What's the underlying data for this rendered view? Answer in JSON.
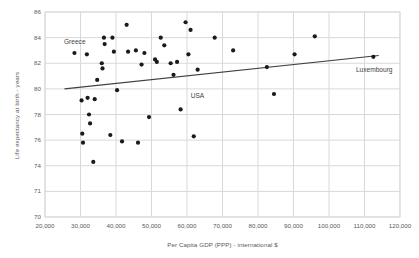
{
  "chart_data": {
    "type": "scatter",
    "title": "",
    "xlabel": "Per Capita GDP (PPP) - international $",
    "ylabel": "Life expectancy at birth - years",
    "xlim": [
      20000,
      120000
    ],
    "ylim": [
      70,
      86
    ],
    "xticks": [
      "20,000",
      "30,000",
      "40,000",
      "50,000",
      "60,000",
      "70,000",
      "80,000",
      "90,000",
      "100,000",
      "110,000",
      "120,000"
    ],
    "yticks": [
      "70",
      "71",
      "74",
      "76",
      "78",
      "80",
      "82",
      "84",
      "86"
    ],
    "ytick_values": [
      70,
      72,
      74,
      76,
      78,
      80,
      82,
      84,
      86
    ],
    "grid": "both",
    "legend": "none",
    "marker_color": "#1a1a1a",
    "trendline_color": "#404040",
    "gridline_color": "#d9d9d9",
    "points": [
      {
        "x": 28300,
        "y": 82.8
      },
      {
        "x": 30300,
        "y": 79.1
      },
      {
        "x": 30500,
        "y": 76.5
      },
      {
        "x": 30700,
        "y": 75.8
      },
      {
        "x": 31800,
        "y": 82.7
      },
      {
        "x": 32000,
        "y": 79.3
      },
      {
        "x": 32400,
        "y": 78.0
      },
      {
        "x": 32700,
        "y": 77.3
      },
      {
        "x": 33600,
        "y": 74.3
      },
      {
        "x": 34000,
        "y": 79.2
      },
      {
        "x": 34700,
        "y": 80.7
      },
      {
        "x": 36000,
        "y": 82.0
      },
      {
        "x": 36200,
        "y": 81.6
      },
      {
        "x": 36600,
        "y": 84.0
      },
      {
        "x": 36800,
        "y": 83.5
      },
      {
        "x": 38400,
        "y": 76.4
      },
      {
        "x": 39000,
        "y": 84.0
      },
      {
        "x": 39400,
        "y": 82.9
      },
      {
        "x": 40300,
        "y": 79.9
      },
      {
        "x": 41700,
        "y": 75.9
      },
      {
        "x": 43000,
        "y": 85.0
      },
      {
        "x": 43400,
        "y": 82.9
      },
      {
        "x": 45600,
        "y": 83.0
      },
      {
        "x": 46200,
        "y": 75.8
      },
      {
        "x": 47200,
        "y": 81.9
      },
      {
        "x": 48000,
        "y": 82.8
      },
      {
        "x": 49300,
        "y": 77.8
      },
      {
        "x": 51000,
        "y": 82.3
      },
      {
        "x": 51500,
        "y": 82.1
      },
      {
        "x": 52600,
        "y": 84.0
      },
      {
        "x": 53600,
        "y": 83.4
      },
      {
        "x": 55400,
        "y": 82.0
      },
      {
        "x": 56200,
        "y": 81.1
      },
      {
        "x": 57200,
        "y": 82.1
      },
      {
        "x": 58200,
        "y": 78.4
      },
      {
        "x": 59600,
        "y": 85.2
      },
      {
        "x": 60400,
        "y": 82.7
      },
      {
        "x": 61000,
        "y": 84.6
      },
      {
        "x": 61900,
        "y": 76.3
      },
      {
        "x": 63000,
        "y": 81.5
      },
      {
        "x": 67800,
        "y": 84.0
      },
      {
        "x": 73000,
        "y": 83.0
      },
      {
        "x": 82500,
        "y": 81.7
      },
      {
        "x": 84500,
        "y": 79.6
      },
      {
        "x": 90300,
        "y": 82.7
      },
      {
        "x": 96000,
        "y": 84.1
      },
      {
        "x": 112500,
        "y": 82.5
      }
    ],
    "annotations": [
      {
        "label": "Greece",
        "x": 28300,
        "y": 83.6
      },
      {
        "label": "USA",
        "x": 62500,
        "y": 79.4
      },
      {
        "label": "Luxembourg",
        "x": 112500,
        "y": 81.4
      }
    ],
    "trendline": {
      "x1": 25500,
      "y1": 80.0,
      "x2": 114000,
      "y2": 82.6
    }
  }
}
